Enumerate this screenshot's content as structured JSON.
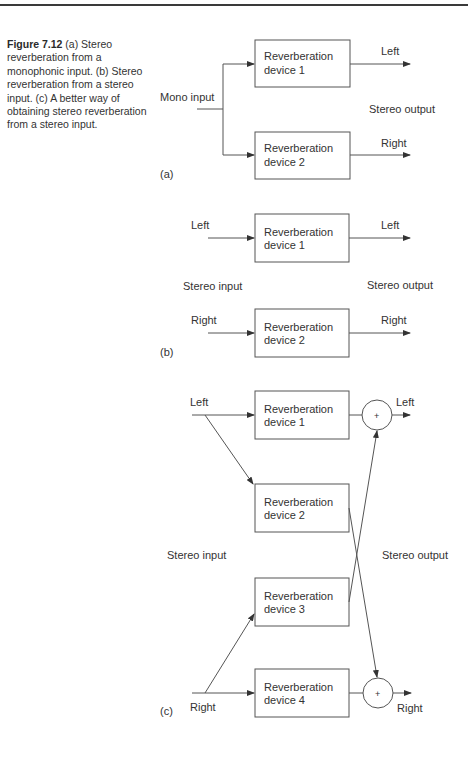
{
  "caption": {
    "figure_label": "Figure 7.12",
    "text": " (a) Stereo reverberation from a monophonic input. (b) Stereo reverberation from a stereo input. (c) A better way of obtaining stereo reverberation from a stereo input."
  },
  "panel_a": {
    "label": "(a)",
    "input_label": "Mono input",
    "output_label": "Stereo output",
    "box1": [
      "Reverberation",
      "device 1"
    ],
    "box2": [
      "Reverberation",
      "device 2"
    ],
    "out_left": "Left",
    "out_right": "Right"
  },
  "panel_b": {
    "label": "(b)",
    "input_label": "Stereo input",
    "output_label": "Stereo output",
    "in_left": "Left",
    "in_right": "Right",
    "box1": [
      "Reverberation",
      "device 1"
    ],
    "box2": [
      "Reverberation",
      "device 2"
    ],
    "out_left": "Left",
    "out_right": "Right"
  },
  "panel_c": {
    "label": "(c)",
    "input_label": "Stereo input",
    "output_label": "Stereo output",
    "in_left": "Left",
    "in_right": "Right",
    "box1": [
      "Reverberation",
      "device 1"
    ],
    "box2": [
      "Reverberation",
      "device 2"
    ],
    "box3": [
      "Reverberation",
      "device 3"
    ],
    "box4": [
      "Reverberation",
      "device 4"
    ],
    "sum_symbol": "+",
    "out_left": "Left",
    "out_right": "Right"
  }
}
